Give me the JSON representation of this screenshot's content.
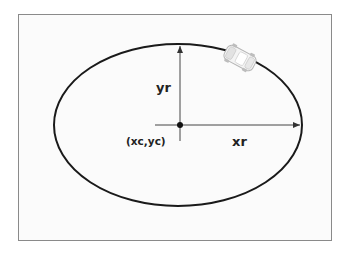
{
  "diagram": {
    "colors": {
      "frame_border": "#8a8a8a",
      "ellipse_stroke": "#1a1a1a",
      "axis_stroke": "#444444",
      "label_text": "#222222"
    },
    "ellipse": {
      "cx": 178,
      "cy": 125,
      "rx": 125,
      "ry": 81
    },
    "labels": {
      "y_radius": "yr",
      "x_radius": "xr",
      "center": "(xc,yc)"
    },
    "icons": {
      "moving_object": "car-icon",
      "center_point": "center-dot-icon"
    }
  }
}
